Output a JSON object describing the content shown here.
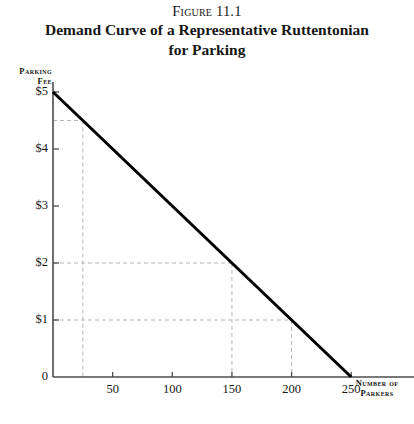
{
  "figure": {
    "number_prefix": "Figure",
    "number": "11.1",
    "title_line1": "Demand Curve of a Representative Ruttentonian",
    "title_line2": "for Parking"
  },
  "chart_data": {
    "type": "line",
    "title": "Demand Curve of a Representative Ruttentonian for Parking",
    "xlabel_line1": "Number of",
    "xlabel_line2": "Parkers",
    "ylabel_line1": "Parking",
    "ylabel_line2": "Fee",
    "xlim": [
      0,
      280
    ],
    "ylim": [
      0,
      5
    ],
    "grid": false,
    "legend": "none",
    "x_ticks": [
      50,
      100,
      150,
      200,
      250
    ],
    "x_tick_labels": [
      "50",
      "100",
      "150",
      "200",
      "250"
    ],
    "y_ticks": [
      0,
      1,
      2,
      3,
      4,
      5
    ],
    "y_tick_labels": [
      "0",
      "$1",
      "$2",
      "$3",
      "$4",
      "$5"
    ],
    "series": [
      {
        "name": "Demand curve",
        "x": [
          0,
          250
        ],
        "y": [
          5,
          0
        ],
        "color": "#000000",
        "width_px": 3
      }
    ],
    "guide_lines": [
      {
        "price": 4.5,
        "quantity": 25,
        "style": "dashed",
        "color": "#b4b4b4"
      },
      {
        "price": 2,
        "quantity": 150,
        "style": "dashed",
        "color": "#b4b4b4"
      },
      {
        "price": 1,
        "quantity": 200,
        "style": "dashed",
        "color": "#b4b4b4"
      }
    ],
    "axis_color": "#4d4d4d",
    "annotations": []
  }
}
